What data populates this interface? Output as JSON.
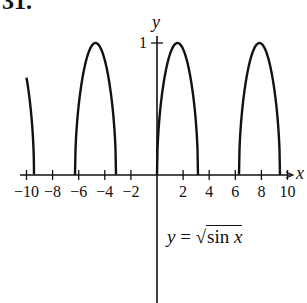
{
  "problem_number": "31.",
  "chart_data": {
    "type": "line",
    "title": "",
    "formula": "y = √sin x",
    "xlabel": "x",
    "ylabel": "y",
    "xlim": [
      -10.5,
      10.8
    ],
    "ylim": [
      -1,
      1.1
    ],
    "x_ticks": [
      -10,
      -8,
      -6,
      -4,
      -2,
      2,
      4,
      6,
      8,
      10
    ],
    "x_tick_labels": [
      "−10",
      "−8",
      "−6",
      "−4",
      "−2",
      "2",
      "4",
      "6",
      "8",
      "10"
    ],
    "y_ticks": [
      1
    ],
    "y_tick_labels": [
      "1"
    ],
    "grid": false,
    "series": [
      {
        "name": "y = sqrt(sin x)",
        "domain_segments": [
          [
            -10,
            -9.4248
          ],
          [
            -6.2832,
            -3.1416
          ],
          [
            0,
            3.1416
          ],
          [
            6.2832,
            9.4248
          ]
        ],
        "max_value": 1,
        "max_at": [
          -4.7124,
          1.5708,
          7.854
        ]
      }
    ]
  },
  "labels": {
    "x_axis": "x",
    "y_axis": "y",
    "formula_lhs": "y =",
    "formula_sqrt": "√",
    "formula_body": "sin",
    "formula_var": "x",
    "y_tick_1": "1",
    "x_ticks": [
      "−10",
      "−8",
      "−6",
      "−4",
      "−2",
      "2",
      "4",
      "6",
      "8",
      "10"
    ]
  }
}
